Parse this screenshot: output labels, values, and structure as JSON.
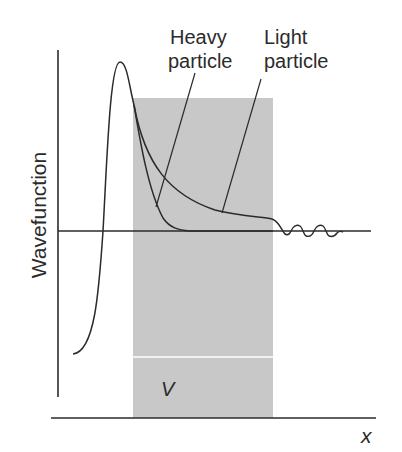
{
  "figure": {
    "y_axis_label": "Wavefunction",
    "x_axis_label": "x",
    "barrier_label": "V",
    "annotations": {
      "heavy": {
        "line1": "Heavy",
        "line2": "particle"
      },
      "light": {
        "line1": "Light",
        "line2": "particle"
      }
    },
    "colors": {
      "barrier": "#c8c8c8",
      "ink": "#2b2b2b",
      "background": "#ffffff"
    }
  }
}
